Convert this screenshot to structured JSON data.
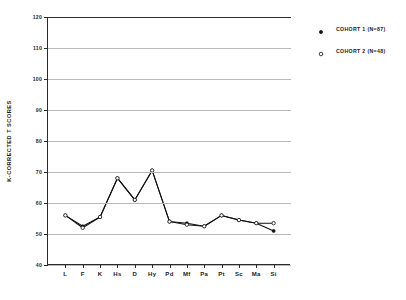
{
  "chart_data": {
    "type": "line",
    "title": "",
    "xlabel": "",
    "ylabel": "K-CORRECTED T SCORES",
    "categories": [
      "L",
      "F",
      "K",
      "Hs",
      "D",
      "Hy",
      "Pd",
      "Mf",
      "Pa",
      "Pt",
      "Sc",
      "Ma",
      "Si"
    ],
    "ylim": [
      40,
      120
    ],
    "yticks": [
      40,
      50,
      60,
      70,
      80,
      90,
      100,
      110,
      120
    ],
    "ytick_labels": [
      "40",
      "50",
      "60",
      "70",
      "80",
      "90",
      "100",
      "110",
      "120"
    ],
    "grid": true,
    "legend_position": "right",
    "series": [
      {
        "name": "COHORT 1 (N=87)",
        "marker": "filled-circle",
        "values": [
          56.0,
          52.5,
          55.5,
          68.0,
          61.0,
          70.5,
          54.0,
          53.5,
          52.5,
          56.0,
          54.5,
          53.5,
          51.0
        ]
      },
      {
        "name": "COHORT 2 (N=48)",
        "marker": "open-circle",
        "values": [
          56.0,
          52.0,
          55.5,
          68.0,
          61.0,
          70.5,
          54.0,
          53.0,
          52.5,
          56.0,
          54.5,
          53.5,
          53.5
        ]
      }
    ]
  },
  "legend": {
    "items": [
      {
        "label": "COHORT 1 (N=87)",
        "marker": "filled-circle-icon"
      },
      {
        "label": "COHORT 2 (N=48)",
        "marker": "open-circle-icon"
      }
    ]
  }
}
